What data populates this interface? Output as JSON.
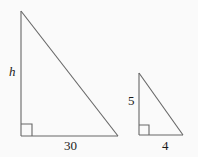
{
  "figure": {
    "background_color": "#fafafa",
    "stroke_color": "#666666",
    "text_color": "#1a1a1a",
    "shapes": [
      {
        "name": "large-right-triangle",
        "vertices": {
          "apex": [
            21,
            11
          ],
          "right_angle": [
            21,
            136
          ],
          "base_end": [
            118,
            136
          ]
        },
        "right_angle_marker": {
          "x": 21,
          "y": 124,
          "size": 11
        },
        "labels": {
          "vertical_leg": "h",
          "horizontal_leg": "30"
        }
      },
      {
        "name": "small-right-triangle",
        "vertices": {
          "apex": [
            139,
            73
          ],
          "right_angle": [
            139,
            135
          ],
          "base_end": [
            183,
            135
          ]
        },
        "right_angle_marker": {
          "x": 139,
          "y": 125,
          "size": 10
        },
        "labels": {
          "vertical_leg": "5",
          "horizontal_leg": "4"
        }
      }
    ]
  },
  "labels": {
    "large_height": "h",
    "large_base": "30",
    "small_height": "5",
    "small_base": "4"
  }
}
